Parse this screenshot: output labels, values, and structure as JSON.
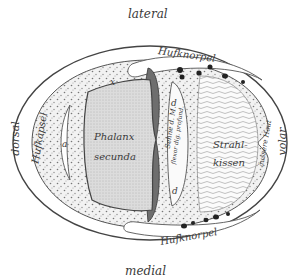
{
  "figure": {
    "colors": {
      "background": "#ffffff",
      "line": "#444444",
      "bone_fill": "#d9d9d9",
      "tendon_fill": "#6e6e6e",
      "stipple_fill": "#efefef",
      "dark_spots": "#222222"
    }
  },
  "orientation": {
    "top": "lateral",
    "bottom": "medial",
    "left": "dorsal",
    "right": "volar"
  },
  "labels": {
    "hufkapsel": "Hufkapsel",
    "hufknorpel_top": "Hufknorpel",
    "hufknorpel_bottom": "Hufknorpel",
    "phalanx_line1": "Phalanx",
    "phalanx_line2": "secunda",
    "strahlkissen_line1": "Strahl-",
    "strahlkissen_line2": "kissen",
    "sehne": "Sehne d. M.",
    "flexor": "flexor dig. profund.",
    "aeussere_haut": "äussere Haut",
    "a_left": "a",
    "d_top": "d",
    "d_bottom": "d",
    "x_left": "x"
  }
}
